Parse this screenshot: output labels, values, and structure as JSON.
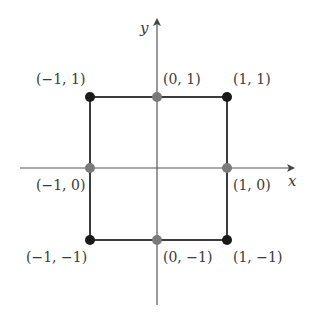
{
  "diagram": {
    "type": "coordinate-plane",
    "axes": {
      "x_label": "x",
      "y_label": "y",
      "origin_px": [
        157,
        168
      ],
      "unit_px": 68.5
    },
    "square": {
      "corners": [
        [
          -1,
          1
        ],
        [
          1,
          1
        ],
        [
          1,
          -1
        ],
        [
          -1,
          -1
        ]
      ],
      "stroke": "#3c3c3c"
    },
    "points": [
      {
        "coord": [
          -1,
          1
        ],
        "label": "(−1, 1)",
        "kind": "corner",
        "color": "#1a1a1a"
      },
      {
        "coord": [
          0,
          1
        ],
        "label": "(0, 1)",
        "kind": "midpoint",
        "color": "#7a7a7a"
      },
      {
        "coord": [
          1,
          1
        ],
        "label": "(1, 1)",
        "kind": "corner",
        "color": "#1a1a1a"
      },
      {
        "coord": [
          -1,
          0
        ],
        "label": "(−1, 0)",
        "kind": "midpoint",
        "color": "#7a7a7a"
      },
      {
        "coord": [
          1,
          0
        ],
        "label": "(1, 0)",
        "kind": "midpoint",
        "color": "#7a7a7a"
      },
      {
        "coord": [
          -1,
          -1
        ],
        "label": "(−1, −1)",
        "kind": "corner",
        "color": "#1a1a1a"
      },
      {
        "coord": [
          0,
          -1
        ],
        "label": "(0, −1)",
        "kind": "midpoint",
        "color": "#7a7a7a"
      },
      {
        "coord": [
          1,
          -1
        ],
        "label": "(1, −1)",
        "kind": "corner",
        "color": "#1a1a1a"
      }
    ]
  }
}
